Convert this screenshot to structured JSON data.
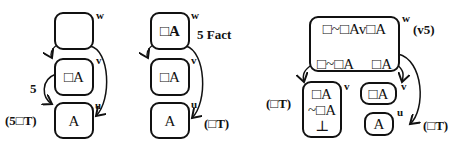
{
  "diagrams": [
    {
      "worlds": [
        {
          "name": "w",
          "content": [
            ""
          ]
        },
        {
          "name": "v",
          "content": [
            "□A"
          ]
        },
        {
          "name": "u",
          "content": [
            "A"
          ]
        }
      ],
      "annotations": {
        "arrow_label": "5",
        "rule": "(5□T)"
      }
    },
    {
      "worlds": [
        {
          "name": "w",
          "content": [
            "□A"
          ]
        },
        {
          "name": "v",
          "content": [
            "□A"
          ]
        },
        {
          "name": "u",
          "content": [
            "A"
          ]
        }
      ],
      "annotations": {
        "fact": "5 Fact",
        "rule": "(□T)"
      }
    },
    {
      "worlds": [
        {
          "name": "w",
          "content": [
            "□~□Av□A"
          ],
          "branches": [
            "□~□A",
            "□A"
          ]
        },
        {
          "name": "v",
          "content": [
            "□A",
            "~□A",
            "⊥"
          ]
        },
        {
          "name": "v",
          "content": [
            "□A"
          ]
        },
        {
          "name": "u",
          "content": [
            "A"
          ]
        }
      ],
      "annotations": {
        "rule_top": "(v5)",
        "rule_left": "(□T)",
        "rule_right": "(□T)"
      }
    }
  ]
}
